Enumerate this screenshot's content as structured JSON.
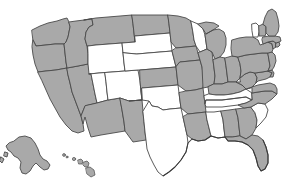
{
  "map": {
    "title": "United States choropleth map",
    "projection": "albers-usa",
    "background_color": "#ffffff",
    "border_color": "#4a4a4a",
    "legend": {
      "filled_color": "#a9a9a9",
      "unfilled_color": "#ffffff",
      "filled_label": "Highlighted",
      "unfilled_label": "Not highlighted"
    },
    "counts": {
      "filled_total": 38,
      "unfilled_total": 12
    },
    "unfilled_states": [
      "Utah",
      "Wyoming",
      "Colorado",
      "South Dakota",
      "Nebraska",
      "Oklahoma",
      "Texas",
      "Wisconsin",
      "Tennessee",
      "Mississippi",
      "South Carolina",
      "Vermont"
    ],
    "states": [
      {
        "code": "WA",
        "name": "Washington",
        "filled": true
      },
      {
        "code": "OR",
        "name": "Oregon",
        "filled": true
      },
      {
        "code": "CA",
        "name": "California",
        "filled": true
      },
      {
        "code": "NV",
        "name": "Nevada",
        "filled": true
      },
      {
        "code": "ID",
        "name": "Idaho",
        "filled": true
      },
      {
        "code": "MT",
        "name": "Montana",
        "filled": true
      },
      {
        "code": "WY",
        "name": "Wyoming",
        "filled": false
      },
      {
        "code": "UT",
        "name": "Utah",
        "filled": false
      },
      {
        "code": "AZ",
        "name": "Arizona",
        "filled": true
      },
      {
        "code": "CO",
        "name": "Colorado",
        "filled": false
      },
      {
        "code": "NM",
        "name": "New Mexico",
        "filled": true
      },
      {
        "code": "ND",
        "name": "North Dakota",
        "filled": true
      },
      {
        "code": "SD",
        "name": "South Dakota",
        "filled": false
      },
      {
        "code": "NE",
        "name": "Nebraska",
        "filled": false
      },
      {
        "code": "KS",
        "name": "Kansas",
        "filled": true
      },
      {
        "code": "OK",
        "name": "Oklahoma",
        "filled": false
      },
      {
        "code": "TX",
        "name": "Texas",
        "filled": false
      },
      {
        "code": "MN",
        "name": "Minnesota",
        "filled": true
      },
      {
        "code": "IA",
        "name": "Iowa",
        "filled": true
      },
      {
        "code": "MO",
        "name": "Missouri",
        "filled": true
      },
      {
        "code": "AR",
        "name": "Arkansas",
        "filled": true
      },
      {
        "code": "LA",
        "name": "Louisiana",
        "filled": true
      },
      {
        "code": "WI",
        "name": "Wisconsin",
        "filled": false
      },
      {
        "code": "IL",
        "name": "Illinois",
        "filled": true
      },
      {
        "code": "MI",
        "name": "Michigan",
        "filled": true
      },
      {
        "code": "IN",
        "name": "Indiana",
        "filled": true
      },
      {
        "code": "OH",
        "name": "Ohio",
        "filled": true
      },
      {
        "code": "KY",
        "name": "Kentucky",
        "filled": true
      },
      {
        "code": "TN",
        "name": "Tennessee",
        "filled": false
      },
      {
        "code": "MS",
        "name": "Mississippi",
        "filled": false
      },
      {
        "code": "AL",
        "name": "Alabama",
        "filled": true
      },
      {
        "code": "GA",
        "name": "Georgia",
        "filled": true
      },
      {
        "code": "FL",
        "name": "Florida",
        "filled": true
      },
      {
        "code": "SC",
        "name": "South Carolina",
        "filled": false
      },
      {
        "code": "NC",
        "name": "North Carolina",
        "filled": true
      },
      {
        "code": "VA",
        "name": "Virginia",
        "filled": true
      },
      {
        "code": "WV",
        "name": "West Virginia",
        "filled": true
      },
      {
        "code": "MD",
        "name": "Maryland",
        "filled": true
      },
      {
        "code": "DE",
        "name": "Delaware",
        "filled": true
      },
      {
        "code": "PA",
        "name": "Pennsylvania",
        "filled": true
      },
      {
        "code": "NJ",
        "name": "New Jersey",
        "filled": true
      },
      {
        "code": "NY",
        "name": "New York",
        "filled": true
      },
      {
        "code": "CT",
        "name": "Connecticut",
        "filled": true
      },
      {
        "code": "RI",
        "name": "Rhode Island",
        "filled": true
      },
      {
        "code": "MA",
        "name": "Massachusetts",
        "filled": true
      },
      {
        "code": "VT",
        "name": "Vermont",
        "filled": false
      },
      {
        "code": "NH",
        "name": "New Hampshire",
        "filled": true
      },
      {
        "code": "ME",
        "name": "Maine",
        "filled": true
      },
      {
        "code": "AK",
        "name": "Alaska",
        "filled": true
      },
      {
        "code": "HI",
        "name": "Hawaii",
        "filled": true
      }
    ]
  }
}
